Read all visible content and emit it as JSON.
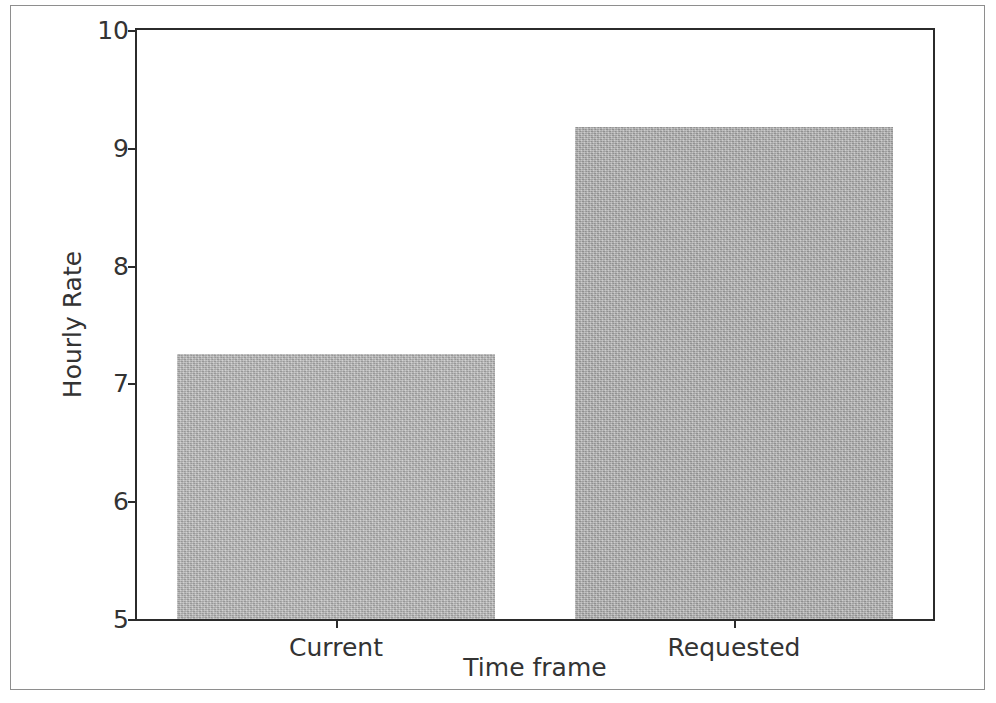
{
  "chart_data": {
    "type": "bar",
    "title": "",
    "categories": [
      "Current",
      "Requested"
    ],
    "values": [
      7.25,
      9.18
    ],
    "xlabel": "Time frame",
    "ylabel": "Hourly Rate",
    "ylim": [
      5,
      10
    ],
    "yticks": [
      "5",
      "6",
      "7",
      "8",
      "9",
      "10"
    ],
    "grid": false,
    "legend": "none",
    "bar_color": "#b0b0b0",
    "axis_color": "#2b2b2b",
    "text_color": "#333333"
  },
  "figure": {
    "background": "#ffffff",
    "frame_color": "#8e8e8e"
  }
}
